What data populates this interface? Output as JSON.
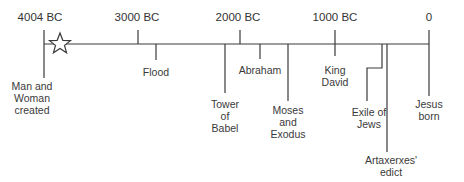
{
  "axis": {
    "ticks": [
      {
        "label": "4004 BC",
        "year": -4004
      },
      {
        "label": "3000 BC",
        "year": -3000
      },
      {
        "label": "2000 BC",
        "year": -2000
      },
      {
        "label": "1000 BC",
        "year": -1000
      },
      {
        "label": "0",
        "year": 0
      }
    ]
  },
  "events": [
    {
      "label": "Man and\nWoman\ncreated",
      "year": -4004,
      "marker": "star-icon"
    },
    {
      "label": "Flood",
      "year": -2350
    },
    {
      "label": "Tower\nof\nBabel",
      "year": -2250
    },
    {
      "label": "Abraham",
      "year": -1900
    },
    {
      "label": "Moses\nand\nExodus",
      "year": -1450
    },
    {
      "label": "King\nDavid",
      "year": -1000
    },
    {
      "label": "Exile of\nJews",
      "year": -590
    },
    {
      "label": "Artaxerxes'\nedict",
      "year": -450
    },
    {
      "label": "Jesus\nborn",
      "year": 0
    }
  ]
}
